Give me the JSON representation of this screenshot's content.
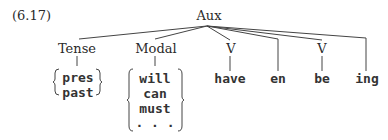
{
  "example_number": "(6.17)",
  "tree": {
    "root": "Aux",
    "children": [
      {
        "label": "Tense",
        "options": [
          "pres",
          "past"
        ]
      },
      {
        "label": "Modal",
        "options": [
          "will",
          "can",
          "must",
          ". . ."
        ]
      },
      {
        "label": "V",
        "child": "have"
      },
      {
        "terminal": "en"
      },
      {
        "label": "V",
        "child": "be"
      },
      {
        "terminal": "ing"
      }
    ]
  },
  "colors": {
    "ink": "#2a2a2a",
    "background": "#ffffff"
  }
}
